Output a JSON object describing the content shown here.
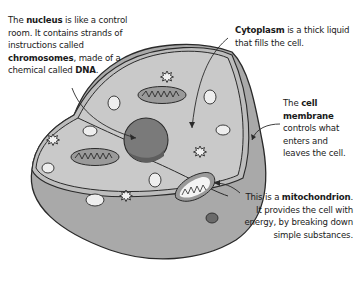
{
  "diagram": {
    "colors": {
      "cytoplasm": "#c9c9c9",
      "side_wall": "#a9a9a9",
      "membrane_band": "#bdbdbd",
      "nucleus": "#7a7a7a",
      "outline": "#2a2a2a",
      "vacuole": "#eeeeee"
    },
    "labels": {
      "nucleus": {
        "term": "nucleus",
        "pre": "The ",
        "post": " is like a control room. It contains strands of instructions called ",
        "term2": "chromosomes",
        "post2": ", made of a chemical called ",
        "term3": "DNA",
        "end": "."
      },
      "cytoplasm": {
        "term": "Cytoplasm",
        "post": " is a thick liquid that fills the cell."
      },
      "membrane": {
        "pre": "The ",
        "term": "cell membrane",
        "post": " controls what enters and leaves the cell."
      },
      "mitochondrion": {
        "pre": "This is a ",
        "term": "mitochondrion",
        "post": ". It provides the cell with energy, by breaking down simple substances."
      }
    }
  }
}
